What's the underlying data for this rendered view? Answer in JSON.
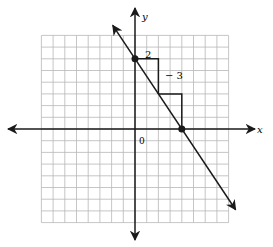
{
  "graph": {
    "x_axis_label": "x",
    "y_axis_label": "y",
    "origin_label": "0",
    "rise_label": "2",
    "run_label": "− 3",
    "grid": {
      "x_min": -8,
      "x_max": 8,
      "y_min": -8,
      "y_max": 8,
      "step": 1
    },
    "line": {
      "points": [
        [
          0,
          6
        ],
        [
          4,
          0
        ]
      ],
      "slope": -1.5,
      "y_intercept": 6,
      "x_intercept": 4
    },
    "slope_steps": [
      {
        "from": [
          0,
          6
        ],
        "horizontal": 2,
        "vertical": -3
      },
      {
        "from": [
          2,
          3
        ],
        "horizontal": 2,
        "vertical": -3
      }
    ],
    "colors": {
      "grid": "#b8b8b8",
      "axes": "#1a1a1a",
      "line": "#1a1a1a"
    }
  }
}
